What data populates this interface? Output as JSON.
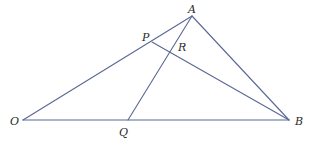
{
  "diagram": {
    "line_color": "#5b6796",
    "label_color": "#2a2a2a",
    "points": {
      "A": {
        "label": "A",
        "x": 192,
        "y": 16,
        "label_x": 188,
        "label_y": 4
      },
      "P": {
        "label": "P",
        "x": 152,
        "y": 42,
        "label_x": 142,
        "label_y": 32
      },
      "R": {
        "label": "R",
        "x": 171,
        "y": 50,
        "label_x": 178,
        "label_y": 42
      },
      "O": {
        "label": "O",
        "x": 23,
        "y": 120,
        "label_x": 10,
        "label_y": 116
      },
      "Q": {
        "label": "Q",
        "x": 128,
        "y": 120,
        "label_x": 119,
        "label_y": 127
      },
      "B": {
        "label": "B",
        "x": 289,
        "y": 120,
        "label_x": 295,
        "label_y": 116
      }
    },
    "segments": [
      {
        "from": "O",
        "to": "A"
      },
      {
        "from": "A",
        "to": "B"
      },
      {
        "from": "O",
        "to": "B"
      },
      {
        "from": "A",
        "to": "Q"
      },
      {
        "from": "P",
        "to": "B"
      }
    ]
  }
}
